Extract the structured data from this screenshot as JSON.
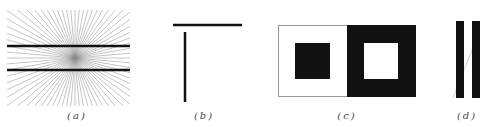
{
  "figure": {
    "panels": [
      {
        "id": "a",
        "caption": "(a)",
        "description": "Hering illusion: two parallel horizontal lines over radiating lines"
      },
      {
        "id": "b",
        "caption": "(b)",
        "description": "Vertical-horizontal illusion: horizontal line above vertical line"
      },
      {
        "id": "c",
        "caption": "(c)",
        "description": "Irradiation illusion: black square on white vs white square on black"
      },
      {
        "id": "d",
        "caption": "(d)",
        "description": "Poggendorff-style illusion: two vertical bars with a diagonal line"
      }
    ]
  },
  "colors": {
    "ink": "#111111",
    "ray": "#888888",
    "border": "#999999",
    "background": "#ffffff"
  }
}
